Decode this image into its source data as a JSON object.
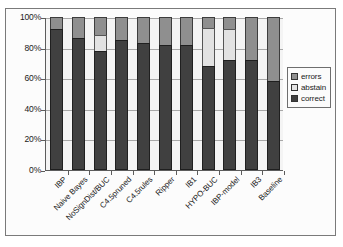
{
  "chart_data": {
    "type": "bar",
    "subtype": "stacked-100-percent",
    "title": "",
    "subtitle": "",
    "xlabel": "",
    "ylabel": "",
    "grid": true,
    "legend_position": "right",
    "ylim": [
      0,
      100
    ],
    "ytick_labels": [
      "100%",
      "80%",
      "60%",
      "40%",
      "20%",
      "0%"
    ],
    "ytick_values": [
      100,
      80,
      60,
      40,
      20,
      0
    ],
    "categories": [
      "IBP",
      "Naive Bayes",
      "NoSignDist/BUC",
      "C4.5pruned",
      "C4.5rules",
      "Ripper",
      "IB1",
      "HYPO-BUC",
      "IBP-model",
      "IB3",
      "Baseline"
    ],
    "series": [
      {
        "name": "correct",
        "color": "#404040",
        "values": [
          92,
          86,
          78,
          85,
          83,
          82,
          82,
          68,
          72,
          72,
          58
        ]
      },
      {
        "name": "abstain",
        "color": "#e2e2e2",
        "values": [
          0,
          0,
          10,
          0,
          0,
          0,
          0,
          25,
          20,
          0,
          0
        ]
      },
      {
        "name": "errors",
        "color": "#8f8f8f",
        "values": [
          8,
          14,
          12,
          15,
          17,
          18,
          18,
          7,
          8,
          28,
          42
        ]
      }
    ],
    "stack_order_bottom_to_top": [
      "correct",
      "abstain",
      "errors"
    ]
  },
  "legend": {
    "items": [
      {
        "label": "errors",
        "color": "#8f8f8f"
      },
      {
        "label": "abstain",
        "color": "#e2e2e2"
      },
      {
        "label": "correct",
        "color": "#404040"
      }
    ]
  }
}
